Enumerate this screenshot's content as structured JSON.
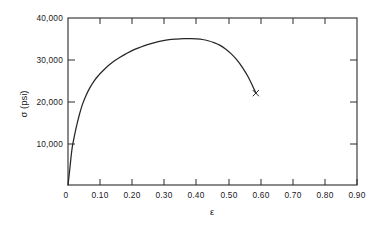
{
  "chart_data": {
    "type": "line",
    "title": "",
    "xlabel": "ε",
    "ylabel": "σ (psi)",
    "xlim": [
      0,
      1.0
    ],
    "ylim": [
      0,
      40000
    ],
    "grid": false,
    "legend": null,
    "x_ticks": [
      0,
      0.1,
      0.2,
      0.3,
      0.4,
      0.5,
      0.6,
      0.7,
      0.8,
      0.9
    ],
    "x_tick_labels": [
      "0",
      "0.10",
      "0.20",
      "0.30",
      "0.40",
      "0.50",
      "0.60",
      "0.70",
      "0.80",
      "0.90"
    ],
    "y_ticks": [
      10000,
      20000,
      30000,
      40000
    ],
    "y_tick_labels": [
      "10,000",
      "20,000",
      "30,000",
      "40,000"
    ],
    "series": [
      {
        "name": "engineering-stress-strain",
        "marker_at_end": "x",
        "x": [
          0.0,
          0.004,
          0.008,
          0.012,
          0.016,
          0.02,
          0.026,
          0.032,
          0.04,
          0.05,
          0.062,
          0.075,
          0.09,
          0.105,
          0.12,
          0.14,
          0.16,
          0.18,
          0.2,
          0.225,
          0.25,
          0.275,
          0.3,
          0.325,
          0.35,
          0.375,
          0.4,
          0.425,
          0.445,
          0.465,
          0.485,
          0.505,
          0.525,
          0.545,
          0.565,
          0.585,
          0.605,
          0.625,
          0.645,
          0.65
        ],
        "y": [
          0,
          2400,
          5000,
          7600,
          9600,
          11000,
          13000,
          14800,
          17000,
          19300,
          21400,
          23200,
          24900,
          26200,
          27300,
          28600,
          29700,
          30600,
          31400,
          32300,
          33000,
          33600,
          34100,
          34500,
          34800,
          34950,
          35050,
          35080,
          35000,
          34850,
          34550,
          34100,
          33500,
          32600,
          31400,
          29900,
          28000,
          25700,
          22800,
          22000
        ]
      }
    ],
    "annotations": {
      "peak_stress": 35080,
      "peak_strain": 0.425,
      "fracture_stress": 22000,
      "fracture_strain": 0.65
    }
  },
  "axes": {
    "x_axis_label": "ε",
    "y_axis_label": "σ (psi)"
  }
}
